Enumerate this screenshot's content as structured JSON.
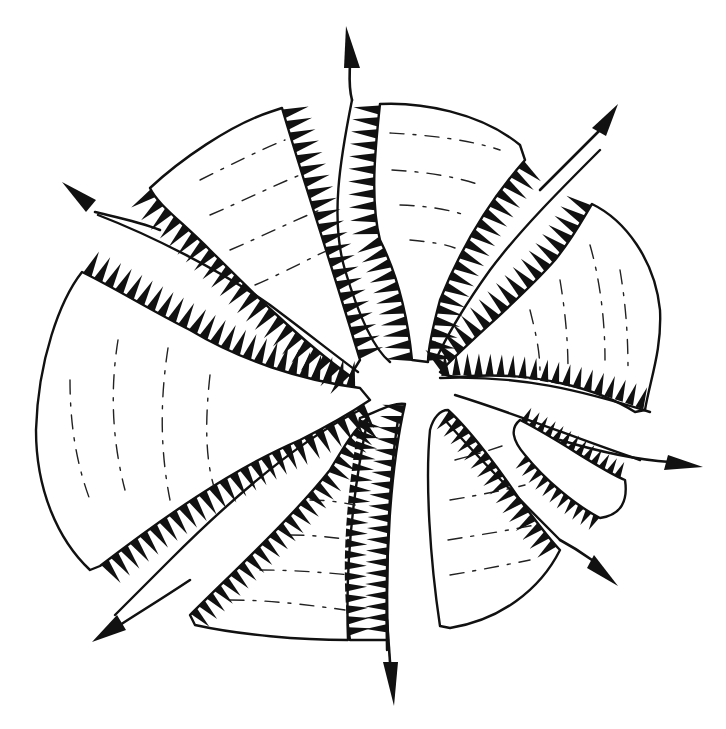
{
  "figure": {
    "title": "",
    "colors": {
      "ink": "#111111",
      "paper": "#ffffff"
    },
    "segment_count": 7,
    "arrow_count": 7,
    "arrows": [
      {
        "name": "arrow-north",
        "direction": "up"
      },
      {
        "name": "arrow-northeast",
        "direction": "up-right"
      },
      {
        "name": "arrow-east",
        "direction": "right"
      },
      {
        "name": "arrow-southeast",
        "direction": "down-right"
      },
      {
        "name": "arrow-south",
        "direction": "down"
      },
      {
        "name": "arrow-southwest",
        "direction": "down-left"
      },
      {
        "name": "arrow-northwest",
        "direction": "up-left"
      }
    ]
  }
}
